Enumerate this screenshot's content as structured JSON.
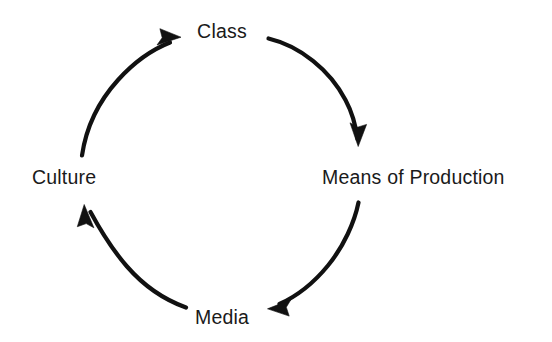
{
  "diagram": {
    "type": "cycle",
    "direction": "clockwise",
    "background_color": "#ffffff",
    "stroke_color": "#111111",
    "text_color": "#1a1a1a",
    "nodes": [
      {
        "id": "class",
        "label": "Class",
        "position": "top"
      },
      {
        "id": "means",
        "label": "Means of Production",
        "position": "right"
      },
      {
        "id": "media",
        "label": "Media",
        "position": "bottom"
      },
      {
        "id": "culture",
        "label": "Culture",
        "position": "left"
      }
    ],
    "edges": [
      {
        "from": "class",
        "to": "means",
        "arrow": "curved-clockwise"
      },
      {
        "from": "means",
        "to": "media",
        "arrow": "curved-clockwise"
      },
      {
        "from": "media",
        "to": "culture",
        "arrow": "curved-clockwise"
      },
      {
        "from": "culture",
        "to": "class",
        "arrow": "curved-clockwise"
      }
    ]
  }
}
